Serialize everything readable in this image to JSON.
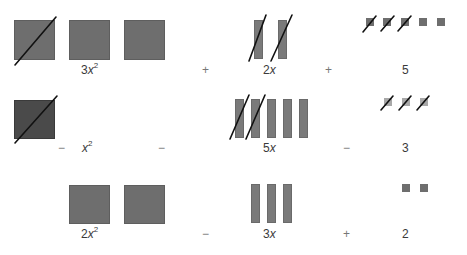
{
  "diagram": {
    "rows": [
      {
        "terms": [
          {
            "coef": "3",
            "var": "x",
            "exp": "2",
            "label": "3x²"
          },
          {
            "coef": "2",
            "var": "x",
            "exp": "",
            "label": "2x"
          },
          {
            "coef": "5",
            "var": "",
            "exp": "",
            "label": "5"
          }
        ],
        "operators": [
          "+",
          "+"
        ]
      },
      {
        "lead_sign": "−",
        "terms": [
          {
            "coef": "",
            "var": "x",
            "exp": "2",
            "label": "x²"
          },
          {
            "coef": "5",
            "var": "x",
            "exp": "",
            "label": "5x"
          },
          {
            "coef": "3",
            "var": "",
            "exp": "",
            "label": "3"
          }
        ],
        "operators": [
          "−",
          "−"
        ]
      },
      {
        "terms": [
          {
            "coef": "2",
            "var": "x",
            "exp": "2",
            "label": "2x²"
          },
          {
            "coef": "3",
            "var": "x",
            "exp": "",
            "label": "3x"
          },
          {
            "coef": "2",
            "var": "",
            "exp": "",
            "label": "2"
          }
        ],
        "operators": [
          "−",
          "+"
        ]
      }
    ],
    "colors": {
      "positive_tile": "#6e6e6e",
      "negative_square": "#4a4a4a",
      "negative_unit": "#a8a8a8",
      "slash": "#111111"
    }
  }
}
